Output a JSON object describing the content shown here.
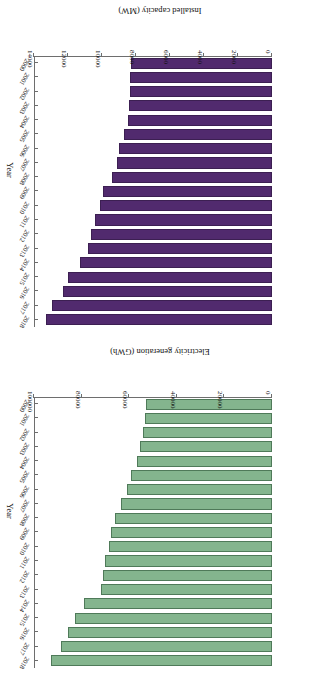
{
  "figure": {
    "background": "#ffffff",
    "orientation_note": "both panels appear rotated 180 degrees in the source scan"
  },
  "chart_data": [
    {
      "id": "installed-capacity",
      "type": "bar",
      "orientation": "horizontal",
      "title": "",
      "xlabel": "Installed capacity (MW)",
      "ylabel": "Year",
      "xlim": [
        0,
        14000
      ],
      "xticks": [
        0,
        2000,
        4000,
        6000,
        8000,
        10000,
        12000,
        14000
      ],
      "xtick_labels": [
        "0",
        "2000",
        "4000",
        "6000",
        "8000",
        "10000",
        "12000",
        "14000"
      ],
      "grid": false,
      "legend": false,
      "color": "#512a6e",
      "edge_color": "#3c1f52",
      "categories": [
        "2018",
        "2017",
        "2016",
        "2015",
        "2014",
        "2013",
        "2012",
        "2011",
        "2010",
        "2009",
        "2008",
        "2007",
        "2006",
        "2005",
        "2004",
        "2003",
        "2002",
        "2001",
        "2000"
      ],
      "values": [
        13200,
        12800,
        12200,
        11900,
        11200,
        10700,
        10500,
        10300,
        10000,
        9800,
        9300,
        9000,
        8900,
        8600,
        8350,
        8300,
        8250,
        8230,
        8200
      ]
    },
    {
      "id": "electricity-generation",
      "type": "bar",
      "orientation": "horizontal",
      "title": "",
      "xlabel": "Electricity generation (GWh)",
      "ylabel": "Year",
      "xlim": [
        0,
        100000
      ],
      "xticks": [
        0,
        20000,
        40000,
        60000,
        80000,
        100000
      ],
      "xtick_labels": [
        "0",
        "20000",
        "40000",
        "60000",
        "80000",
        "100000"
      ],
      "grid": false,
      "legend": false,
      "color": "#84b58e",
      "edge_color": "#4f7a59",
      "categories": [
        "2018",
        "2017",
        "2016",
        "2015",
        "2014",
        "2013",
        "2012",
        "2011",
        "2010",
        "2009",
        "2008",
        "2007",
        "2006",
        "2005",
        "2004",
        "2003",
        "2002",
        "2001",
        "2000"
      ],
      "values": [
        92000,
        88000,
        85000,
        82000,
        78000,
        71000,
        70000,
        69500,
        67500,
        67000,
        65000,
        62500,
        60000,
        58500,
        56000,
        54500,
        53500,
        52500,
        52000
      ]
    }
  ]
}
